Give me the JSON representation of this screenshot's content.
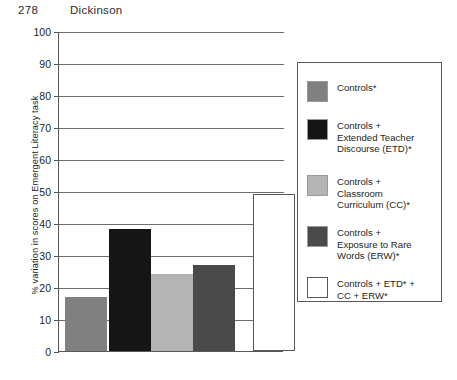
{
  "header": {
    "page_number": "278",
    "running_head": "Dickinson"
  },
  "chart_data": {
    "type": "bar",
    "title": "",
    "xlabel": "",
    "ylabel": "% variation in scores on Emergent Literacy task",
    "ylim": [
      0,
      100
    ],
    "ytick_labels": [
      "100",
      "90",
      "80",
      "70",
      "60",
      "50",
      "40",
      "30",
      "20",
      "10",
      "0"
    ],
    "ytick_values": [
      100,
      90,
      80,
      70,
      60,
      50,
      40,
      30,
      20,
      10,
      0
    ],
    "grid": true,
    "xtick_labels": [],
    "legend_position": "right",
    "categories": [
      "Controls*",
      "Controls + Extended Teacher Discourse (ETD)*",
      "Controls + Classroom Curriculum (CC)*",
      "Controls + Exposure to Rare Words (ERW)*",
      "Controls +  ETD* + CC + ERW*"
    ],
    "values": [
      17,
      38,
      24,
      27,
      49
    ],
    "colors": [
      "#808080",
      "#151515",
      "#b4b4b4",
      "#4a4a4a",
      "#ffffff"
    ]
  },
  "legend": {
    "items": [
      {
        "label": "Controls*",
        "color": "#808080",
        "swatch_name": "legend-swatch-controls"
      },
      {
        "label": "Controls +\nExtended Teacher\nDiscourse (ETD)*",
        "color": "#151515",
        "swatch_name": "legend-swatch-etd"
      },
      {
        "label": "Controls +\nClassroom\nCurriculum (CC)*",
        "color": "#b4b4b4",
        "swatch_name": "legend-swatch-cc"
      },
      {
        "label": "Controls +\nExposure to Rare\nWords (ERW)*",
        "color": "#4a4a4a",
        "swatch_name": "legend-swatch-erw"
      },
      {
        "label": "Controls +  ETD* +\nCC + ERW*",
        "color": "#ffffff",
        "swatch_name": "legend-swatch-combined"
      }
    ]
  }
}
